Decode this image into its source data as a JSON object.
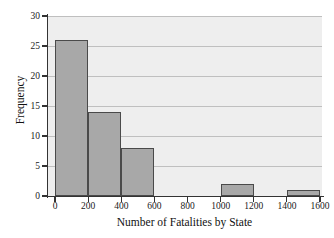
{
  "chart_data": {
    "type": "bar",
    "title": "",
    "subtitle": "",
    "xlabel": "Number of Fatalities by State",
    "ylabel": "Frequency",
    "categories": [
      "0-200",
      "200-400",
      "400-600",
      "600-800",
      "800-1000",
      "1000-1200",
      "1200-1400",
      "1400-1600"
    ],
    "bin_edges": [
      0,
      200,
      400,
      600,
      800,
      1000,
      1200,
      1400,
      1600
    ],
    "values": [
      26,
      14,
      8,
      0,
      0,
      2,
      0,
      1
    ],
    "xlim": [
      0,
      1600
    ],
    "ylim": [
      0,
      30
    ],
    "xticks": [
      "0",
      "200",
      "400",
      "600",
      "800",
      "1000",
      "1200",
      "1400",
      "1600"
    ],
    "xtick_values": [
      0,
      200,
      400,
      600,
      800,
      1000,
      1200,
      1400,
      1600
    ],
    "yticks": [
      "0",
      "5",
      "10",
      "15",
      "20",
      "25",
      "30"
    ],
    "ytick_values": [
      0,
      5,
      10,
      15,
      20,
      25,
      30
    ],
    "grid": "horizontal",
    "legend": "none",
    "colors": {
      "bar_fill": "#a8a8a8",
      "bar_border": "#4a4a4a",
      "plot_background": "#eeeeee",
      "gridline": "#bfbfbf",
      "axis": "#333333",
      "text": "#111111",
      "page_background": "#ffffff"
    }
  }
}
